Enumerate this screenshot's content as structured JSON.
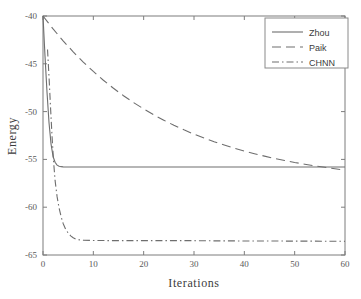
{
  "chart_data": {
    "type": "line",
    "title": "",
    "xlabel": "Iterations",
    "ylabel": "Energy",
    "xlim": [
      0,
      60
    ],
    "ylim": [
      -65,
      -40
    ],
    "xticks": [
      0,
      10,
      20,
      30,
      40,
      50,
      60
    ],
    "yticks": [
      -65,
      -60,
      -55,
      -50,
      -45,
      -40
    ],
    "xtick_labels": [
      "0",
      "10",
      "20",
      "30",
      "40",
      "50",
      "60"
    ],
    "ytick_labels": [
      "-65",
      "-60",
      "-55",
      "-50",
      "-45",
      "-40"
    ],
    "grid": false,
    "legend_position": "upper right",
    "series": [
      {
        "name": "Zhou",
        "style": "solid",
        "color": "#6e6e6e",
        "x": [
          0,
          0.4,
          0.8,
          1.2,
          1.6,
          2,
          2.4,
          2.8,
          3.2,
          3.6,
          4,
          5,
          6,
          8,
          10,
          14,
          18,
          22,
          26,
          30,
          34,
          38,
          42,
          46,
          50,
          54,
          58,
          60
        ],
        "y": [
          -40.0,
          -44.2,
          -48.0,
          -51.2,
          -53.4,
          -54.7,
          -55.3,
          -55.6,
          -55.72,
          -55.76,
          -55.78,
          -55.8,
          -55.8,
          -55.8,
          -55.8,
          -55.8,
          -55.8,
          -55.8,
          -55.8,
          -55.8,
          -55.8,
          -55.8,
          -55.8,
          -55.8,
          -55.8,
          -55.8,
          -55.8,
          -55.8
        ]
      },
      {
        "name": "Paik",
        "style": "dashed",
        "color": "#6e6e6e",
        "x": [
          0,
          2,
          4,
          6,
          8,
          10,
          12,
          14,
          16,
          18,
          20,
          22,
          24,
          26,
          28,
          30,
          32,
          34,
          36,
          38,
          40,
          42,
          44,
          46,
          48,
          50,
          52,
          54,
          56,
          58,
          60
        ],
        "y": [
          -40.0,
          -41.35,
          -42.6,
          -43.75,
          -44.82,
          -45.8,
          -46.72,
          -47.56,
          -48.34,
          -49.06,
          -49.72,
          -50.34,
          -50.9,
          -51.43,
          -51.91,
          -52.36,
          -52.77,
          -53.15,
          -53.5,
          -53.83,
          -54.13,
          -54.4,
          -54.66,
          -54.9,
          -55.11,
          -55.32,
          -55.5,
          -55.67,
          -55.83,
          -55.98,
          -56.12
        ]
      },
      {
        "name": "CHNN",
        "style": "dashdot",
        "color": "#6e6e6e",
        "x": [
          0.9,
          1.2,
          1.5,
          1.8,
          2.1,
          2.4,
          2.8,
          3.2,
          3.6,
          4,
          4.5,
          5,
          5.5,
          6,
          6.5,
          7,
          8,
          10,
          14,
          18,
          22,
          26,
          30,
          34,
          40,
          46,
          52,
          58,
          60
        ],
        "y": [
          -43.5,
          -46.4,
          -49.6,
          -52.6,
          -55.2,
          -57.2,
          -58.9,
          -60.1,
          -61.0,
          -61.7,
          -62.3,
          -62.7,
          -63.0,
          -63.2,
          -63.33,
          -63.4,
          -63.45,
          -63.48,
          -63.5,
          -63.5,
          -63.5,
          -63.5,
          -63.5,
          -63.52,
          -63.53,
          -63.54,
          -63.55,
          -63.56,
          -63.57
        ]
      }
    ]
  },
  "legend": {
    "entries": [
      {
        "label": "Zhou"
      },
      {
        "label": "Paik"
      },
      {
        "label": "CHNN"
      }
    ]
  },
  "axes": {
    "x_title": "Iterations",
    "y_title": "Energy"
  }
}
